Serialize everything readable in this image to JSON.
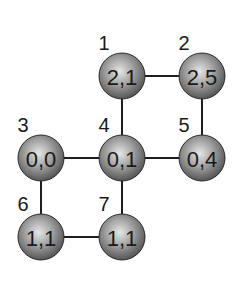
{
  "diagram": {
    "type": "graph",
    "nodes": [
      {
        "id": "1",
        "index_label": "1",
        "value": "2,1",
        "cx": 122,
        "cy": 76
      },
      {
        "id": "2",
        "index_label": "2",
        "value": "2,5",
        "cx": 202,
        "cy": 76
      },
      {
        "id": "3",
        "index_label": "3",
        "value": "0,0",
        "cx": 41,
        "cy": 158
      },
      {
        "id": "4",
        "index_label": "4",
        "value": "0,1",
        "cx": 122,
        "cy": 158
      },
      {
        "id": "5",
        "index_label": "5",
        "value": "0,4",
        "cx": 202,
        "cy": 158
      },
      {
        "id": "6",
        "index_label": "6",
        "value": "1,1",
        "cx": 41,
        "cy": 237
      },
      {
        "id": "7",
        "index_label": "7",
        "value": "1,1",
        "cx": 122,
        "cy": 237
      }
    ],
    "edges": [
      {
        "from": "1",
        "to": "2"
      },
      {
        "from": "1",
        "to": "4"
      },
      {
        "from": "2",
        "to": "5"
      },
      {
        "from": "3",
        "to": "4"
      },
      {
        "from": "4",
        "to": "5"
      },
      {
        "from": "3",
        "to": "6"
      },
      {
        "from": "4",
        "to": "7"
      },
      {
        "from": "6",
        "to": "7"
      }
    ],
    "colors": {
      "node_fill_light": "#d8d8d8",
      "node_fill_dark": "#5a5a5a",
      "node_stroke": "#2a2a2a",
      "edge": "#1e1e1e",
      "text": "#1a1a1a"
    }
  }
}
